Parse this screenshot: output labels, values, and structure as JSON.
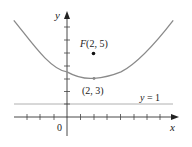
{
  "figure": {
    "type": "parabola-focus-directrix",
    "equation": "y = (x - 2)^2 / 8 + 3",
    "axes": {
      "x_label": "x",
      "y_label": "y",
      "origin_label": "0",
      "x_ticks": [
        -3,
        -2,
        -1,
        1,
        2,
        3,
        4,
        5,
        6,
        7
      ],
      "y_ticks": [
        1,
        2,
        3,
        4,
        5,
        6,
        7
      ],
      "x_range": [
        -4,
        8.3
      ],
      "y_range": [
        -1.2,
        8
      ]
    },
    "focus": {
      "label": "F(2, 5)",
      "x": 2,
      "y": 5
    },
    "vertex": {
      "label": "(2, 3)",
      "x": 2,
      "y": 3
    },
    "directrix": {
      "label": "y = 1",
      "y": 1
    },
    "curve_domain": [
      -4,
      8
    ],
    "colors": {
      "curve": "#8a8a8a",
      "axes": "#333333",
      "directrix": "#b0b0b0",
      "focus_dot": "#111111",
      "text": "#222222"
    }
  }
}
